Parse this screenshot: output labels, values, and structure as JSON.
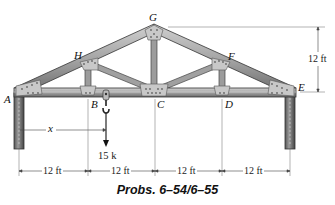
{
  "figure": {
    "caption": "Probs. 6–54/6–55",
    "joints": {
      "A": "A",
      "B": "B",
      "C": "C",
      "D": "D",
      "E": "E",
      "F": "F",
      "G": "G",
      "H": "H"
    },
    "load": {
      "label": "15 k",
      "direction": "down"
    },
    "position_variable": "x",
    "height_dimension": "12 ft",
    "span_dimensions": [
      "12 ft",
      "12 ft",
      "12 ft",
      "12 ft"
    ],
    "colors": {
      "member_fill": "#a9a9a9",
      "member_dark": "#555555",
      "gusset": "#c8c8c8",
      "dimension_line": "#444444"
    }
  }
}
